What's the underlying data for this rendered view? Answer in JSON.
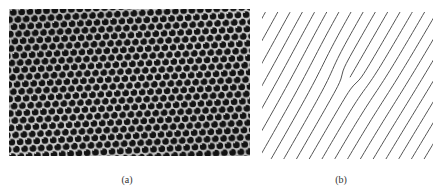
{
  "figure": {
    "panels": [
      {
        "id": "a",
        "caption": "(a)",
        "content": "photograph of hexagonal close-packed lattice (dark holes with bright boundaries)",
        "lattice": {
          "spacing_px": 8.3,
          "row_spacing_px": 7.2,
          "hole_radius_px": 3.3,
          "rotation_deg": -3,
          "hole_color": "#111111",
          "boundary_color": "#d8d8d8"
        }
      },
      {
        "id": "b",
        "caption": "(b)",
        "content": "parallel diagonal lattice lines with an edge dislocation (one extra half-line terminating near center)",
        "lines": {
          "color": "#555555",
          "stroke_width": 1,
          "horizontal_spacing_px": 12.5,
          "angle_deg": 60,
          "core": [
            87,
            69
          ],
          "count_range": [
            -12,
            12
          ],
          "clip": [
            0,
            2,
            171,
            147
          ]
        }
      }
    ]
  }
}
